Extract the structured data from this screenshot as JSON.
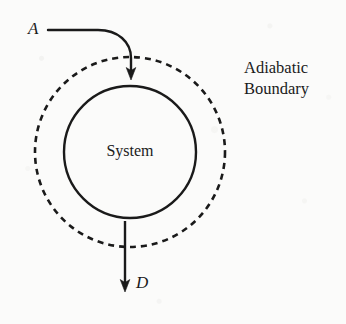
{
  "diagram": {
    "background_color": "#fbfbfa",
    "ink_color": "#1a1a1a",
    "labels": {
      "inflow": "A",
      "outflow": "D",
      "system": "System",
      "boundary_line1": "Adiabatic",
      "boundary_line2": "Boundary"
    },
    "shapes": {
      "system_circle": {
        "name": "system-circle",
        "style": "solid",
        "cx": 130,
        "cy": 152,
        "r": 66,
        "stroke_width": 2.4,
        "stroke_color": "#1a1a1a"
      },
      "boundary_circle": {
        "name": "adiabatic-boundary-circle",
        "style": "dashed",
        "cx": 130,
        "cy": 152,
        "r": 95,
        "stroke_width": 2.6,
        "stroke_color": "#1a1a1a",
        "dash_pattern": "6 5"
      },
      "inflow_arrow": {
        "name": "inflow-arrow",
        "direction": "into-system",
        "start_x": 48,
        "start_y": 30,
        "end_x": 131,
        "end_y": 79
      },
      "outflow_arrow": {
        "name": "outflow-arrow",
        "direction": "out-of-system",
        "start_x": 125,
        "start_y": 221,
        "end_x": 125,
        "end_y": 291
      }
    }
  }
}
